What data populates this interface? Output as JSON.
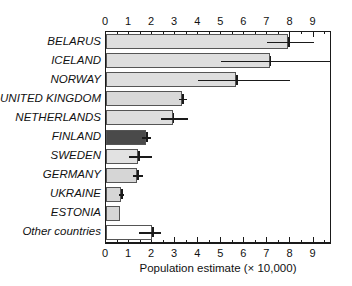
{
  "chart_data": {
    "type": "bar",
    "orientation": "horizontal",
    "title": "",
    "xlabel": "Population estimate (× 10,000)",
    "ylabel": "",
    "xlim": [
      0,
      9.8
    ],
    "grid": false,
    "legend": null,
    "x_ticks_major": [
      0,
      1,
      2,
      3,
      4,
      5,
      6,
      7,
      8,
      9
    ],
    "x_tick_labels": [
      "0",
      "1",
      "2",
      "3",
      "4",
      "5",
      "6",
      "7",
      "8",
      "9"
    ],
    "x_ticks_minor_step": 0.5,
    "axis_positions": [
      "top",
      "bottom"
    ],
    "categories": [
      "BELARUS",
      "ICELAND",
      "NORWAY",
      "UNITED KINGDOM",
      "NETHERLANDS",
      "FINLAND",
      "SWEDEN",
      "GERMANY",
      "UKRAINE",
      "ESTONIA",
      "Other countries"
    ],
    "values": [
      7.9,
      7.1,
      5.65,
      3.3,
      2.9,
      1.75,
      1.4,
      1.35,
      0.65,
      0.6,
      2.0
    ],
    "error_low": [
      7.0,
      5.0,
      4.0,
      3.15,
      2.4,
      1.55,
      1.0,
      1.15,
      0.55,
      null,
      1.45
    ],
    "error_high": [
      9.0,
      9.8,
      8.0,
      3.5,
      3.55,
      1.95,
      2.0,
      1.6,
      0.8,
      null,
      2.4
    ],
    "bar_colors": [
      "#dedede",
      "#dedede",
      "#dedede",
      "#d8d8d8",
      "#dedede",
      "#4a4a4a",
      "#e2e2e2",
      "#d6d6d6",
      "#d6d6d6",
      "#d6d6d6",
      "#ffffff"
    ],
    "highlight_category": "FINLAND",
    "highlight_color": "#4a4a4a",
    "bar_edge_color": "#555555",
    "error_bar_color": "#1a1a1a",
    "axis_color": "#1a1a1a",
    "background_color": "#ffffff"
  }
}
